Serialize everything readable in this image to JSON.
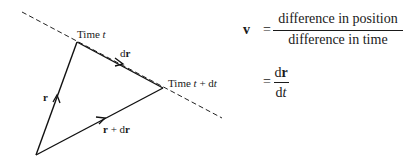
{
  "diagram": {
    "labels": {
      "time_t": {
        "prefix": "Time ",
        "var": "t"
      },
      "time_t_dt": {
        "prefix": "Time ",
        "var": "t",
        "mid": " + d",
        "var2": "t"
      },
      "r": "r",
      "dr": {
        "d": "d",
        "r": "r"
      },
      "r_plus_dr": {
        "r": "r",
        "plus": " + d",
        "r2": "r"
      }
    },
    "points": {
      "origin": [
        36,
        155
      ],
      "time_t": [
        77,
        42
      ],
      "time_t_dt": [
        163,
        88
      ]
    },
    "dashed_line": {
      "start": [
        22,
        12
      ],
      "end": [
        222,
        118
      ]
    }
  },
  "equations": {
    "line1": {
      "lhs": "v",
      "equals": "=",
      "numerator": "difference in position",
      "denominator": "difference in time"
    },
    "line2": {
      "equals": "=",
      "numerator": {
        "d": "d",
        "r": "r"
      },
      "denominator": {
        "d": "d",
        "t": "t"
      }
    }
  }
}
